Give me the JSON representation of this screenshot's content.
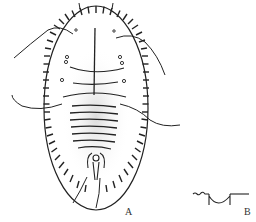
{
  "figure": {
    "type": "scientific-illustration",
    "panels": [
      {
        "id": "A",
        "label": "A",
        "description": "whole body, dorsal view"
      },
      {
        "id": "B",
        "label": "B",
        "description": "detail of marginal structure"
      }
    ],
    "colors": {
      "ink": "#222222",
      "stipple": "#555555",
      "background": "#ffffff"
    }
  }
}
